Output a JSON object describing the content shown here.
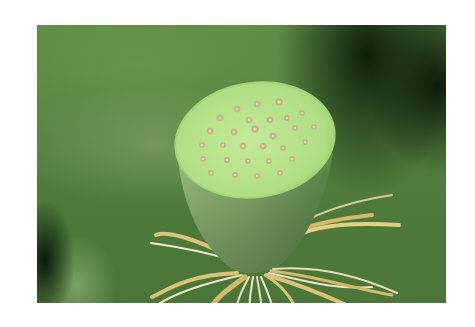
{
  "image": {
    "subject": "Lotus seed pod with stamens",
    "alt": "Close-up of a green lotus seed pod with seed holes on top and yellowish stamens radiating below, against a blurred green background",
    "colors": {
      "background": "#4f7c3c",
      "pod_top": "#b6e28a",
      "pod_side": "#7ea86a",
      "seed_hole": "#c9a57a",
      "stamen": "#d8c27a",
      "stamen_highlight": "#efe6c8",
      "frame": "#ffffff"
    }
  }
}
